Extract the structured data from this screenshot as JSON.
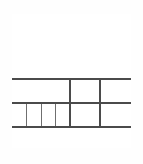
{
  "canvas": {
    "width": 143,
    "height": 164,
    "background_color": "#ffffff"
  },
  "wireframe": {
    "title": "Wireframe Layout",
    "stroke_color": "#4b4b4b",
    "thin_stroke_color": "#6f6f6f",
    "fill_color": "#ffffff",
    "frame": {
      "x": 12,
      "y": 14,
      "width": 119,
      "height": 134,
      "border_width": 2
    },
    "rows": [
      {
        "name": "hero",
        "label": "",
        "y": 14,
        "height": 65,
        "cells": [
          {
            "name": "hero-panel",
            "label": "",
            "x": 12,
            "width": 119
          }
        ]
      },
      {
        "name": "row-2",
        "label": "",
        "y": 79,
        "height": 24,
        "cells": [
          {
            "name": "row2-cell-1",
            "label": "",
            "x": 12,
            "width": 58
          },
          {
            "name": "row2-cell-2",
            "label": "",
            "x": 70,
            "width": 30
          },
          {
            "name": "row2-cell-3",
            "label": "",
            "x": 100,
            "width": 31
          }
        ]
      },
      {
        "name": "row-3",
        "label": "",
        "y": 103,
        "height": 24,
        "cells": [
          {
            "name": "row3-segmented-strip",
            "label": "",
            "x": 12,
            "width": 58,
            "segments": 4
          },
          {
            "name": "row3-cell-1",
            "label": "",
            "x": 70,
            "width": 30
          },
          {
            "name": "row3-cell-2",
            "label": "",
            "x": 100,
            "width": 31
          }
        ]
      },
      {
        "name": "footer",
        "label": "",
        "y": 127,
        "height": 21,
        "cells": [
          {
            "name": "footer-panel",
            "label": "",
            "x": 12,
            "width": 119
          }
        ]
      }
    ],
    "segmented_strip": {
      "name": "row3-segmented-strip",
      "segment_count": 4,
      "segments": [
        {
          "name": "segment-1",
          "label": ""
        },
        {
          "name": "segment-2",
          "label": ""
        },
        {
          "name": "segment-3",
          "label": ""
        },
        {
          "name": "segment-4",
          "label": ""
        }
      ]
    },
    "horizontal_rules": [
      {
        "name": "rule-1",
        "y": 78
      },
      {
        "name": "rule-2",
        "y": 102
      },
      {
        "name": "rule-3",
        "y": 126
      }
    ],
    "vertical_rules": [
      {
        "name": "vrule-a",
        "x": 69,
        "y": 78,
        "height": 48
      },
      {
        "name": "vrule-b",
        "x": 99,
        "y": 78,
        "height": 48
      }
    ]
  }
}
